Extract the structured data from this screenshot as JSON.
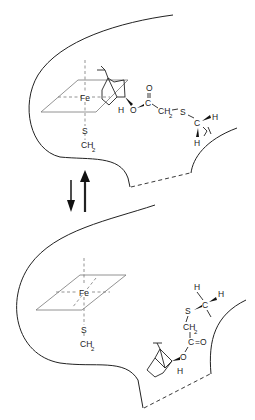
{
  "figure": {
    "type": "enzyme active-site binding diagram",
    "states": [
      {
        "name": "upper-state",
        "metal_label": "Fe",
        "axial_ligand": [
          "S",
          "CH",
          "2"
        ],
        "substrate_labels": {
          "h_bridgehead": "H",
          "ester_oxygen": "O",
          "carbonyl_carbon": "C",
          "carbonyl_oxygen": "O",
          "methylene": "CH",
          "methylene_sub": "2",
          "thioether_s": "S",
          "methyl_c": "C",
          "methyl_h_right": "H",
          "methyl_h_bottom": "H"
        }
      },
      {
        "name": "lower-state",
        "metal_label": "Fe",
        "axial_ligand": [
          "S",
          "CH",
          "2"
        ],
        "substrate_labels": {
          "methyl_h_top": "H",
          "methyl_h_right": "H",
          "methyl_c": "C",
          "thioether_s": "S",
          "methylene": "CH",
          "methylene_sub": "2",
          "carbonyl_carbon": "C",
          "carbonyl_double": "=O",
          "ester_oxygen": "O",
          "h_bridgehead": "H"
        }
      }
    ],
    "equilibrium_arrows": {
      "down": "forward",
      "up": "reverse"
    }
  }
}
